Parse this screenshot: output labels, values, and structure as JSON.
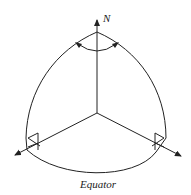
{
  "diagram": {
    "labels": {
      "north": "N",
      "equator": "Equator"
    },
    "colors": {
      "line": "#222222",
      "background": "#ffffff"
    },
    "elements": [
      "spherical-triangle-octant",
      "north-axis-arrow",
      "angle-arc-at-pole",
      "right-angle-marker-left",
      "right-angle-marker-right",
      "equator-arc"
    ]
  }
}
